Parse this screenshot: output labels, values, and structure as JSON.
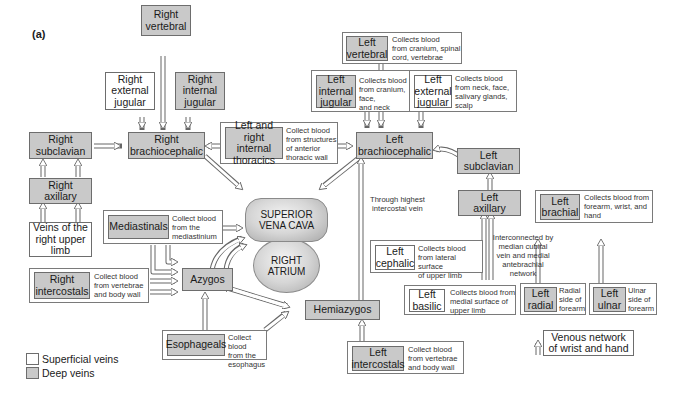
{
  "panel_label": "(a)",
  "heart": {
    "superior_vena_cava": "SUPERIOR\nVENA CAVA",
    "right_atrium": "RIGHT\nATRIUM"
  },
  "right_side": {
    "vertebral": "Right\nvertebral",
    "external_jugular": "Right\nexternal\njugular",
    "internal_jugular": "Right\ninternal\njugular",
    "subclavian": "Right\nsubclavian",
    "brachiocephalic": "Right\nbrachiocephalic",
    "axillary": "Right\naxillary",
    "upper_limb_veins": "Veins of the\nright upper\nlimb",
    "intercostals": "Right\nintercostals",
    "intercostals_desc": "Collect blood\nfrom vertebrae\nand body wall"
  },
  "central": {
    "internal_thoracics": "Left and\nright internal\nthoracics",
    "internal_thoracics_desc": "Collect blood\nfrom structures\nof anterior\nthoracic wall",
    "mediastinals": "Mediastinals",
    "mediastinals_desc": "Collect blood\nfrom the\nmediastinium",
    "azygos": "Azygos",
    "hemiazygos": "Hemiazygos",
    "esophageals": "Esophageals",
    "esophageals_desc": "Collect blood\nfrom the\nesophagus",
    "highest_intercostal_note": "Through highest\nintercostal vein"
  },
  "left_side": {
    "vertebral": "Left\nvertebral",
    "vertebral_desc": "Collects blood\nfrom cranium, spinal\ncord, vertebrae",
    "internal_jugular": "Left\ninternal\njugular",
    "internal_jugular_desc": "Collects blood\nfrom cranium, face,\nand neck",
    "external_jugular": "Left\nexternal\njugular",
    "external_jugular_desc": "Collects blood\nfrom neck, face,\nsalivary glands,\nscalp",
    "brachiocephalic": "Left\nbrachiocephalic",
    "subclavian": "Left\nsubclavian",
    "axillary": "Left\naxillary",
    "brachial": "Left\nbrachial",
    "brachial_desc": "Collects blood from\nforearm, wrist, and\nhand",
    "cephalic": "Left\ncephalic",
    "cephalic_desc": "Collects blood\nfrom lateral surface\nof upper limb",
    "interconnected_note": "Interconnected by\nmedian cubital\nvein and medial\nantebrachial\nnetwork",
    "basilic": "Left\nbasilic",
    "basilic_desc": "Collects blood from\nmedial surface of\nupper limb",
    "radial": "Left\nradial",
    "radial_desc": "Radial\nside of\nforearm",
    "ulnar": "Left\nulnar",
    "ulnar_desc": "Ulnar\nside of\nforearm",
    "venous_network": "Venous network\nof wrist and hand",
    "intercostals": "Left\nintercostals",
    "intercostals_desc": "Collect blood\nfrom vertebrae\nand body wall"
  },
  "legend": {
    "superficial": "Superficial veins",
    "deep": "Deep veins"
  },
  "colors": {
    "deep_fill": "#c9c9c9",
    "superficial_fill": "#ffffff",
    "border": "#6d6d6d"
  }
}
